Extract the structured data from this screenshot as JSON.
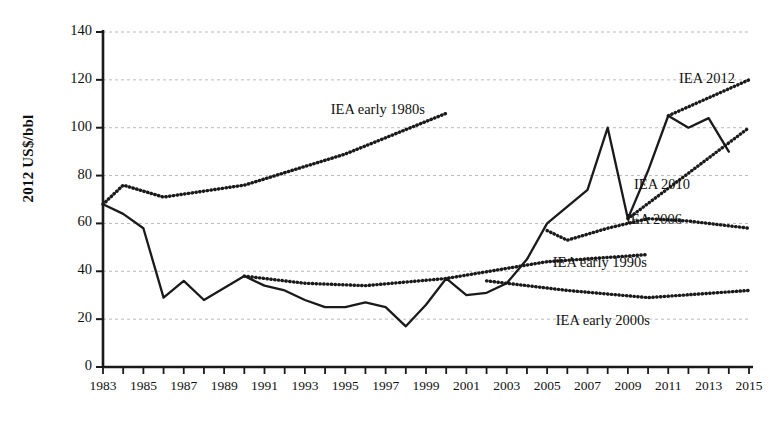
{
  "chart_data": {
    "type": "line",
    "title": "",
    "xlabel": "",
    "ylabel": "2012 US$/bbl",
    "xlim": [
      1983,
      2015
    ],
    "ylim": [
      0,
      140
    ],
    "ytick_step": 20,
    "yticks": [
      0,
      20,
      40,
      60,
      80,
      100,
      120,
      140
    ],
    "xticks": [
      1983,
      1985,
      1987,
      1989,
      1991,
      1993,
      1995,
      1997,
      1999,
      2001,
      2003,
      2005,
      2007,
      2009,
      2011,
      2013,
      2015
    ],
    "xtick_minor_every": 1,
    "grid": "horizontal-dashed",
    "legend": "inline-annotations",
    "series": [
      {
        "name": "Actual oil price",
        "style": "solid",
        "x": [
          1983,
          1984,
          1985,
          1986,
          1987,
          1988,
          1989,
          1990,
          1991,
          1992,
          1993,
          1994,
          1995,
          1996,
          1997,
          1998,
          1999,
          2000,
          2001,
          2002,
          2003,
          2004,
          2005,
          2006,
          2007,
          2008,
          2009,
          2010,
          2011,
          2012,
          2013,
          2014
        ],
        "values": [
          68,
          64,
          58,
          29,
          36,
          28,
          33,
          38,
          34,
          32,
          28,
          25,
          25,
          27,
          25,
          17,
          26,
          37,
          30,
          31,
          35,
          45,
          60,
          67,
          74,
          100,
          62,
          82,
          105,
          100,
          104,
          90
        ]
      },
      {
        "name": "IEA early 1980s",
        "style": "dotted",
        "x": [
          1983,
          1984,
          1986,
          1990,
          1995,
          2000
        ],
        "values": [
          68,
          76,
          71,
          76,
          89,
          106
        ]
      },
      {
        "name": "IEA early 1990s",
        "style": "dotted",
        "x": [
          1990,
          1993,
          1996,
          2000,
          2005,
          2010
        ],
        "values": [
          38,
          35,
          34,
          37,
          44,
          47
        ]
      },
      {
        "name": "IEA early 2000s",
        "style": "dotted",
        "x": [
          2002,
          2006,
          2010,
          2015
        ],
        "values": [
          36,
          32,
          29,
          32
        ]
      },
      {
        "name": "IEA 2006",
        "style": "dotted",
        "x": [
          2005,
          2006,
          2008,
          2010,
          2012,
          2015
        ],
        "values": [
          57,
          53,
          58,
          62,
          61,
          58
        ]
      },
      {
        "name": "IEA 2010",
        "style": "dotted",
        "x": [
          2009,
          2015
        ],
        "values": [
          62,
          100
        ]
      },
      {
        "name": "IEA 2012",
        "style": "dotted",
        "x": [
          2011,
          2015
        ],
        "values": [
          105,
          120
        ]
      }
    ],
    "annotations": [
      {
        "text": "IEA 2012",
        "x": 735,
        "y": 70
      },
      {
        "text": "IEA early 1980s",
        "x": 425,
        "y": 101
      },
      {
        "text": "IEA 2010",
        "x": 690,
        "y": 176
      },
      {
        "text": "IEA 2006",
        "x": 682,
        "y": 211
      },
      {
        "text": "IEA early 1990s",
        "x": 647,
        "y": 254
      },
      {
        "text": "IEA early 2000s",
        "x": 650,
        "y": 312
      }
    ],
    "colors": {
      "line": "#1a1a1a",
      "grid": "#b9b9b9",
      "axis": "#1a1a1a",
      "background": "#ffffff"
    }
  }
}
